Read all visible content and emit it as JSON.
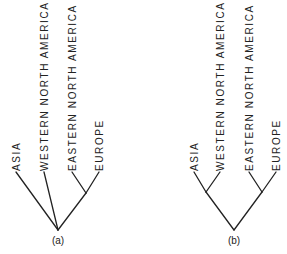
{
  "figure": {
    "panels": [
      {
        "caption": "(a)",
        "description": "Cladogram with unresolved trichotomy: Asia, Western North America, and (Eastern North America + Europe)",
        "taxa": [
          "ASIA",
          "WESTERN NORTH AMERICA",
          "EASTERN NORTH AMERICA",
          "EUROPE"
        ],
        "topology": "(ASIA, WESTERN NORTH AMERICA, (EASTERN NORTH AMERICA, EUROPE))"
      },
      {
        "caption": "(b)",
        "description": "Fully resolved cladogram: (Asia + Western North America) and (Eastern North America + Europe)",
        "taxa": [
          "ASIA",
          "WESTERN NORTH AMERICA",
          "EASTERN NORTH AMERICA",
          "EUROPE"
        ],
        "topology": "((ASIA, WESTERN NORTH AMERICA), (EASTERN NORTH AMERICA, EUROPE))"
      }
    ],
    "colors": {
      "line": "#222222",
      "background": "#ffffff"
    }
  }
}
